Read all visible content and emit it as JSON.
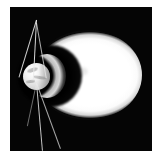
{
  "figure": {
    "domain_label": "scientific-visualization",
    "title": "",
    "caption": "",
    "panel": {
      "background_color": "#050505",
      "frame_color": "#ffffff",
      "x": 10,
      "y": 7,
      "width": 142,
      "height": 144
    }
  },
  "scene": {
    "description": "Planetary magnetosphere simulation: a bright plasma lobe trails to the right of a small central planet surrounded by a dark magnetospheric cavity, with straight field lines radiating above and below the planet.",
    "features": [
      {
        "name": "plasma-lobe",
        "label": "Bright plasma lobe",
        "shape": "ellipse",
        "color": "#ffffff",
        "center_x": 88,
        "center_y": 75,
        "semi_major_px": 54,
        "semi_minor_px": 45
      },
      {
        "name": "dark-cavity",
        "label": "Dark magnetospheric cavity",
        "shape": "circle",
        "color": "#000000",
        "center_x": 51,
        "center_y": 76,
        "radius_px": 31
      },
      {
        "name": "crescent-shell",
        "label": "Gray crescent shock shell",
        "shape": "crescent",
        "color": "#dcdcdc",
        "center_x": 47,
        "center_y": 76,
        "radius_px": 19
      },
      {
        "name": "planet-body",
        "label": "Central planet",
        "shape": "sphere",
        "color": "#eeeeee",
        "center_x": 36,
        "center_y": 76,
        "radius_px": 14
      }
    ],
    "field_lines": [
      {
        "name": "field-line-1",
        "label": "Field line upper-right",
        "angle_deg": 17,
        "length_px": 60,
        "color": "#e9e9e9"
      },
      {
        "name": "field-line-2",
        "label": "Field line upper-center",
        "angle_deg": 3,
        "length_px": 60,
        "color": "#e9e9e9"
      },
      {
        "name": "field-line-3",
        "label": "Field line upper-left",
        "angle_deg": -10,
        "length_px": 56,
        "color": "#e9e9e9"
      },
      {
        "name": "field-line-4",
        "label": "Field line lower-center",
        "angle_deg": -5,
        "length_px": 68,
        "color": "#e9e9e9"
      },
      {
        "name": "field-line-5",
        "label": "Field line lower-left",
        "angle_deg": -20,
        "length_px": 70,
        "color": "#e9e9e9"
      },
      {
        "name": "field-line-6",
        "label": "Field line lower-right",
        "angle_deg": 12,
        "length_px": 44,
        "color": "#e9e9e9"
      }
    ]
  },
  "colors": {
    "background": "#ffffff",
    "panel": "#050505",
    "plasma": "#ffffff",
    "cavity": "#000000",
    "shell": "#dcdcdc",
    "planet": "#eeeeee",
    "field_line": "#e9e9e9"
  }
}
